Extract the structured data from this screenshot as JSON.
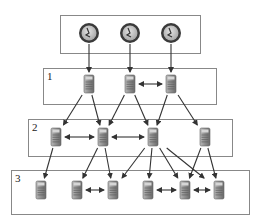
{
  "diagram": {
    "type": "hierarchy",
    "clock_box": {
      "x": 60,
      "y": 15,
      "w": 140,
      "h": 38
    },
    "layers": [
      {
        "label": "1",
        "box": {
          "x": 43,
          "y": 68,
          "w": 173,
          "h": 36
        }
      },
      {
        "label": "2",
        "box": {
          "x": 28,
          "y": 119,
          "w": 204,
          "h": 37
        }
      },
      {
        "label": "3",
        "box": {
          "x": 11,
          "y": 170,
          "w": 238,
          "h": 44
        }
      }
    ],
    "clocks": [
      {
        "id": "c1",
        "x": 89,
        "y": 33
      },
      {
        "id": "c2",
        "x": 130,
        "y": 33
      },
      {
        "id": "c3",
        "x": 171,
        "y": 33
      }
    ],
    "servers": [
      {
        "id": "s1a",
        "layer": 1,
        "x": 89,
        "y": 84
      },
      {
        "id": "s1b",
        "layer": 1,
        "x": 130,
        "y": 84
      },
      {
        "id": "s1c",
        "layer": 1,
        "x": 171,
        "y": 84
      },
      {
        "id": "s2a",
        "layer": 2,
        "x": 56,
        "y": 137
      },
      {
        "id": "s2b",
        "layer": 2,
        "x": 103,
        "y": 137
      },
      {
        "id": "s2c",
        "layer": 2,
        "x": 153,
        "y": 137
      },
      {
        "id": "s2d",
        "layer": 2,
        "x": 205,
        "y": 137
      },
      {
        "id": "s3a",
        "layer": 3,
        "x": 41,
        "y": 190
      },
      {
        "id": "s3b",
        "layer": 3,
        "x": 77,
        "y": 190
      },
      {
        "id": "s3c",
        "layer": 3,
        "x": 113,
        "y": 190
      },
      {
        "id": "s3d",
        "layer": 3,
        "x": 148,
        "y": 190
      },
      {
        "id": "s3e",
        "layer": 3,
        "x": 185,
        "y": 190
      },
      {
        "id": "s3f",
        "layer": 3,
        "x": 219,
        "y": 190
      }
    ],
    "edges": [
      {
        "from": "c1",
        "to": "s1a"
      },
      {
        "from": "c2",
        "to": "s1b"
      },
      {
        "from": "c3",
        "to": "s1c"
      },
      {
        "from": "s1a",
        "to": "s2a"
      },
      {
        "from": "s1a",
        "to": "s2b"
      },
      {
        "from": "s1b",
        "to": "s2b"
      },
      {
        "from": "s1b",
        "to": "s2c"
      },
      {
        "from": "s1c",
        "to": "s2c"
      },
      {
        "from": "s1c",
        "to": "s2d"
      },
      {
        "from": "s2a",
        "to": "s3a"
      },
      {
        "from": "s2b",
        "to": "s3b"
      },
      {
        "from": "s2b",
        "to": "s3c"
      },
      {
        "from": "s2c",
        "to": "s3c"
      },
      {
        "from": "s2c",
        "to": "s3d"
      },
      {
        "from": "s2c",
        "to": "s3e"
      },
      {
        "from": "s2c",
        "to": "s3f"
      },
      {
        "from": "s2d",
        "to": "s3e"
      },
      {
        "from": "s2d",
        "to": "s3f"
      }
    ],
    "peer_links": [
      {
        "a": "s1b",
        "b": "s1c"
      },
      {
        "a": "s2a",
        "b": "s2b"
      },
      {
        "a": "s2b",
        "b": "s2c"
      },
      {
        "a": "s3b",
        "b": "s3c"
      },
      {
        "a": "s3d",
        "b": "s3e"
      },
      {
        "a": "s3e",
        "b": "s3f"
      }
    ],
    "colors": {
      "box_stroke": "#888888",
      "arrow": "#333333",
      "clock_rim": "#3a3a3a",
      "clock_face": "#c8c8c8",
      "server_body": "#9a9a9a",
      "server_dark": "#6e6e6e"
    }
  }
}
